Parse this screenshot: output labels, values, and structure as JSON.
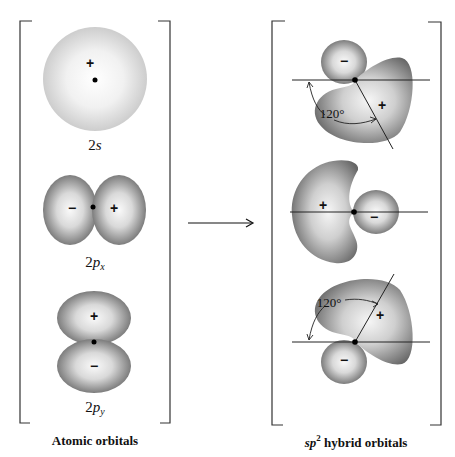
{
  "left_panel": {
    "caption": "Atomic orbitals",
    "orbitals": [
      {
        "id": "2s",
        "label_main": "2",
        "label_italic": "s",
        "label_sub": "",
        "signs": [
          "+"
        ]
      },
      {
        "id": "2px",
        "label_main": "2",
        "label_italic": "p",
        "label_sub": "x",
        "signs": [
          "−",
          "+"
        ]
      },
      {
        "id": "2py",
        "label_main": "2",
        "label_italic": "p",
        "label_sub": "y",
        "signs": [
          "+",
          "−"
        ]
      }
    ]
  },
  "transition": {
    "arrow": "right-arrow"
  },
  "right_panel": {
    "caption_italic": "sp",
    "caption_sup": "2",
    "caption_rest": " hybrid orbitals",
    "hybrids": [
      {
        "id": "hybrid-top",
        "big_sign": "+",
        "small_sign": "−",
        "angle_label": "120°"
      },
      {
        "id": "hybrid-middle",
        "big_sign": "+",
        "small_sign": "−"
      },
      {
        "id": "hybrid-bottom",
        "big_sign": "+",
        "small_sign": "−",
        "angle_label": "120°"
      }
    ]
  },
  "colors": {
    "lobe_edge": "#6e6e6e",
    "lobe_center": "#f4f4f4",
    "s_edge": "#cfcfcf",
    "line": "#222222"
  }
}
